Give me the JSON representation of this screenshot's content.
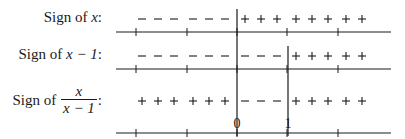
{
  "rows": [
    {
      "label_prefix": "Sign of ",
      "label_expr": "x",
      "label_suffix": ":",
      "signs": [
        "−",
        "−",
        "−",
        "−",
        "−",
        "−",
        "+",
        "+",
        "+",
        "+",
        "+",
        "+",
        "+",
        "+"
      ]
    },
    {
      "label_prefix": "Sign of ",
      "label_expr": "x − 1",
      "label_suffix": ":",
      "signs": [
        "−",
        "−",
        "−",
        "−",
        "−",
        "−",
        "−",
        "−",
        "−",
        "+",
        "+",
        "+",
        "+",
        "+"
      ]
    },
    {
      "label_prefix": "Sign of ",
      "label_frac_num": "x",
      "label_frac_den": "x − 1",
      "label_suffix": ":",
      "signs": [
        "+",
        "+",
        "+",
        "+",
        "+",
        "+",
        "−",
        "−",
        "−",
        "+",
        "+",
        "+",
        "+",
        "+"
      ]
    }
  ],
  "critical_points": [
    {
      "value": "0",
      "x": 237
    },
    {
      "value": "1",
      "x": 288
    }
  ],
  "colors": {
    "ink": "#1a1a1a",
    "background": "#ffffff"
  }
}
